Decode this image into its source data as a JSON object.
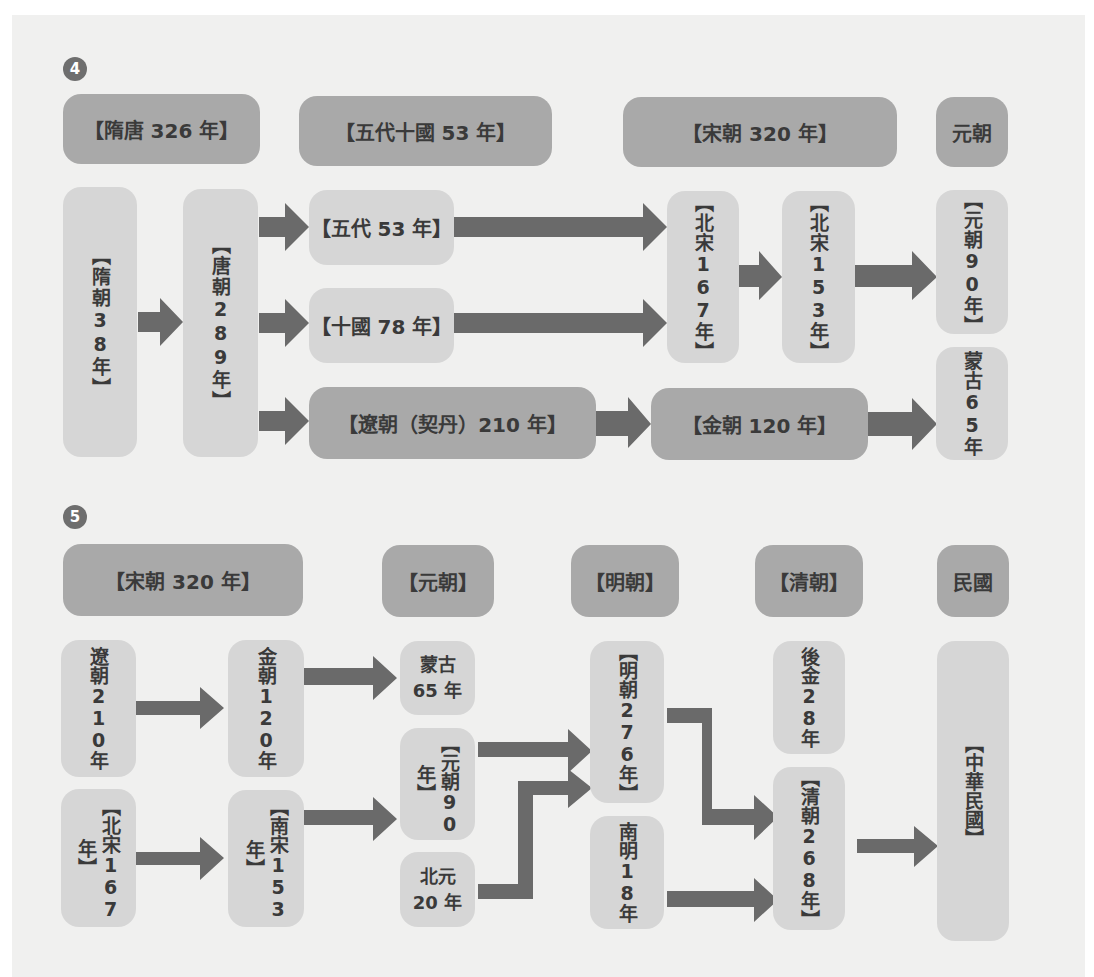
{
  "colors": {
    "background": "#f0f0ef",
    "box_dark": "#a9a9a9",
    "box_light": "#d6d6d6",
    "arrow": "#6a6a6a",
    "text": "#3a3a3a",
    "badge": "#6e6e6e"
  },
  "diagram4": {
    "badge": "4",
    "headers": [
      "【隋唐 326 年】",
      "【五代十國 53 年】",
      "【宋朝 320 年】",
      "元朝"
    ],
    "nodes": {
      "sui": "【隋朝38年】",
      "tang": "【唐朝289年】",
      "wudai": "【五代 53 年】",
      "shiguo": "【十國 78 年】",
      "liao": "【遼朝（契丹）210 年】",
      "beisong": "【北宋167年】",
      "beisong2": "【北宋153年】",
      "jin": "【金朝 120 年】",
      "yuan": "【元朝90年】",
      "menggu": "蒙古65年"
    },
    "edges": [
      [
        "sui",
        "tang"
      ],
      [
        "tang",
        "wudai"
      ],
      [
        "tang",
        "shiguo"
      ],
      [
        "tang",
        "liao"
      ],
      [
        "wudai",
        "beisong"
      ],
      [
        "shiguo",
        "beisong"
      ],
      [
        "beisong",
        "beisong2"
      ],
      [
        "beisong2",
        "yuan"
      ],
      [
        "liao",
        "jin"
      ],
      [
        "jin",
        "menggu"
      ]
    ]
  },
  "diagram5": {
    "badge": "5",
    "headers": [
      "【宋朝 320 年】",
      "【元朝】",
      "【明朝】",
      "【清朝】",
      "民國"
    ],
    "nodes": {
      "liao": "遼朝210年",
      "jin": "金朝120年",
      "menggu": "蒙古65 年",
      "beisong": "【北宋167年】",
      "nansong": "【南宋153年】",
      "yuan": "【元朝90年】",
      "beiyuan": "北元20 年",
      "ming": "【明朝276年】",
      "nanming": "南明18年",
      "houjin": "後金28年",
      "qing": "【清朝268年】",
      "roc": "【中華民國】"
    },
    "edges": [
      [
        "liao",
        "jin"
      ],
      [
        "jin",
        "menggu"
      ],
      [
        "beisong",
        "nansong"
      ],
      [
        "nansong",
        "yuan"
      ],
      [
        "yuan",
        "ming"
      ],
      [
        "beiyuan",
        "ming"
      ],
      [
        "ming",
        "qing"
      ],
      [
        "nanming",
        "qing"
      ],
      [
        "qing",
        "roc"
      ]
    ]
  }
}
